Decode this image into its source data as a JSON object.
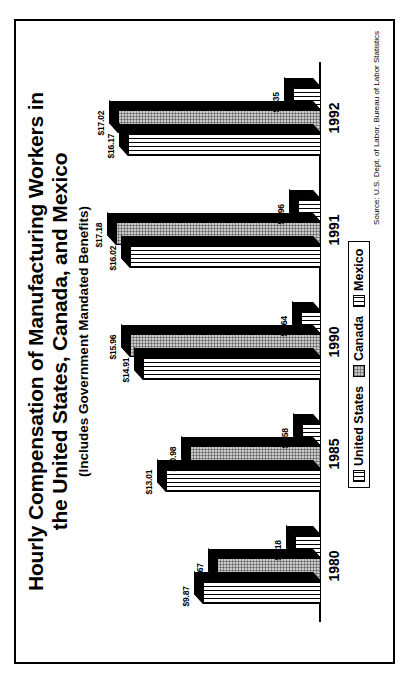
{
  "chart_data": {
    "type": "bar",
    "title": "Hourly Compensation of Manufacturing Workers in the United States, Canada, and Mexico",
    "title_line1": "Hourly Compensation of Manufacturing Workers in",
    "title_line2": "the United States, Canada, and Mexico",
    "subtitle": "(Includes Government Mandated Benefits)",
    "xlabel": "",
    "ylabel": "",
    "ylim": [
      0,
      18
    ],
    "grid": false,
    "legend_position": "bottom-center",
    "orientation": "rotated-90ccw",
    "categories": [
      "1980",
      "1985",
      "1990",
      "1991",
      "1992"
    ],
    "series": [
      {
        "name": "United States",
        "pattern": "vertical-lines",
        "values": [
          9.87,
          13.01,
          14.91,
          16.02,
          16.17
        ],
        "labels": [
          "$9.87",
          "$13.01",
          "$14.91",
          "$16.02",
          "$16.17"
        ]
      },
      {
        "name": "Canada",
        "pattern": "gray-dotted",
        "values": [
          8.67,
          10.98,
          15.96,
          17.18,
          17.02
        ],
        "labels": [
          "$8.67",
          "$10.98",
          "$15.96",
          "$17.18",
          "$17.02"
        ]
      },
      {
        "name": "Mexico",
        "pattern": "checkered",
        "values": [
          2.18,
          1.58,
          1.64,
          1.96,
          2.35
        ],
        "labels": [
          "$2.18",
          "$1.58",
          "$1.64",
          "$1.96",
          "$2.35"
        ]
      }
    ],
    "source": "Source: U.S. Dept. of Labor, Bureau of Labor Statistics"
  },
  "legend": {
    "items": [
      {
        "label": "United States"
      },
      {
        "label": "Canada"
      },
      {
        "label": "Mexico"
      }
    ]
  },
  "colors": {
    "outline": "#000000",
    "background": "#ffffff",
    "canada_fill": "#c9c9c9",
    "bar_side": "#000000"
  }
}
